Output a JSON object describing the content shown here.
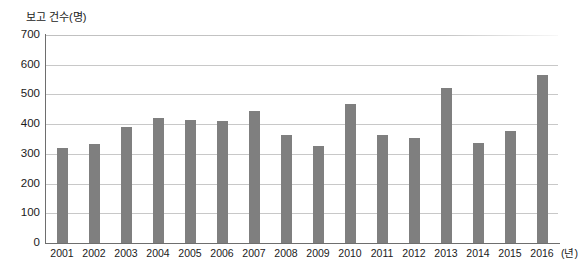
{
  "chart_data": {
    "type": "bar",
    "title": "",
    "subtitle": "",
    "xlabel": "(년)",
    "ylabel": "보고 건수(명)",
    "categories": [
      "2001",
      "2002",
      "2003",
      "2004",
      "2005",
      "2006",
      "2007",
      "2008",
      "2009",
      "2010",
      "2011",
      "2012",
      "2013",
      "2014",
      "2015",
      "2016"
    ],
    "values": [
      320,
      332,
      390,
      422,
      415,
      412,
      445,
      365,
      325,
      468,
      362,
      355,
      522,
      335,
      377,
      565
    ],
    "series": [
      {
        "name": "보고 건수",
        "values": [
          320,
          332,
          390,
          422,
          415,
          412,
          445,
          365,
          325,
          468,
          362,
          355,
          522,
          335,
          377,
          565
        ]
      }
    ],
    "ylim": [
      0,
      700
    ],
    "ytick_step": 100,
    "ytick_labels": [
      "0",
      "100",
      "200",
      "300",
      "400",
      "500",
      "600",
      "700"
    ],
    "grid": true,
    "grid_orientation": "horizontal",
    "legend": false,
    "legend_position": "none",
    "bar_color": "#7f7f7f",
    "grid_color": "#c8c8c8",
    "axis_color": "#6e6e6e",
    "background_color": "#ffffff",
    "annotations": []
  }
}
